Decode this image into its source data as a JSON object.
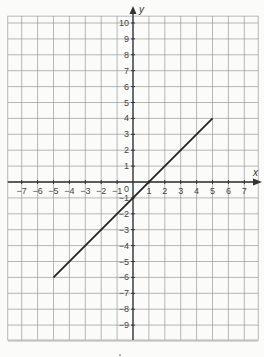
{
  "chart_data": {
    "type": "line",
    "title": "",
    "xlabel": "x",
    "ylabel": "y",
    "xlim": [
      -8,
      8
    ],
    "ylim": [
      -10,
      11
    ],
    "grid": true,
    "x_ticks": [
      -7,
      -6,
      -5,
      -4,
      -3,
      -2,
      -1,
      1,
      2,
      3,
      4,
      5,
      6,
      7
    ],
    "y_ticks": [
      10,
      9,
      8,
      7,
      6,
      5,
      4,
      3,
      2,
      1,
      -1,
      -2,
      -3,
      -4,
      -5,
      -6,
      -7,
      -8,
      -9
    ],
    "x_tick_labels": [
      "−7",
      "−6",
      "−5",
      "−4",
      "−3",
      "−2",
      "−1",
      "1",
      "2",
      "3",
      "4",
      "5",
      "6",
      "7"
    ],
    "y_tick_labels": [
      "10",
      "9",
      "8",
      "7",
      "6",
      "5",
      "4",
      "3",
      "2",
      "1",
      "−1",
      "−2",
      "−3",
      "−4",
      "−5",
      "−6",
      "−7",
      "−8",
      "−9"
    ],
    "origin_label": "0",
    "series": [
      {
        "name": "y = x − 1",
        "points": [
          [
            -5,
            -6
          ],
          [
            5,
            4
          ]
        ],
        "color": "#222222"
      }
    ]
  },
  "layout": {
    "origin_px": [
      133,
      182
    ],
    "cell_px": 15.9,
    "grid_color": "#9a9a9a",
    "axis_color": "#333333"
  }
}
